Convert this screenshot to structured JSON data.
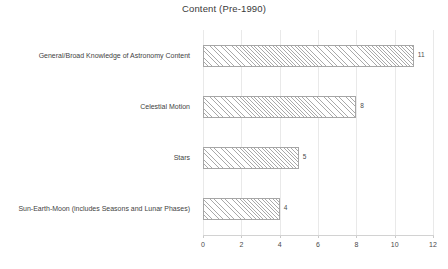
{
  "chart_data": {
    "type": "bar",
    "orientation": "horizontal",
    "title": "Content (Pre-1990)",
    "xlabel": "",
    "ylabel": "",
    "categories": [
      "General/Broad Knowledge of Astronomy Content",
      "Celestial Motion",
      "Stars",
      "Sun-Earth-Moon (includes Seasons and Lunar Phases)"
    ],
    "values": [
      11,
      8,
      5,
      4
    ],
    "data_labels": [
      "11",
      "8",
      "5",
      "4"
    ],
    "xlim": [
      0,
      12
    ],
    "xticks": [
      0,
      2,
      4,
      6,
      8,
      10,
      12
    ],
    "xtick_labels": [
      "0",
      "2",
      "4",
      "6",
      "8",
      "10",
      "12"
    ],
    "grid": "vertical",
    "legend": "none",
    "bar_fill": "#ffffff",
    "bar_pattern": "diagonal-hatch",
    "bar_border_color": "#a6a6a6",
    "gridline_color": "#e9e9e9",
    "text_color": "#3f3f3f"
  }
}
